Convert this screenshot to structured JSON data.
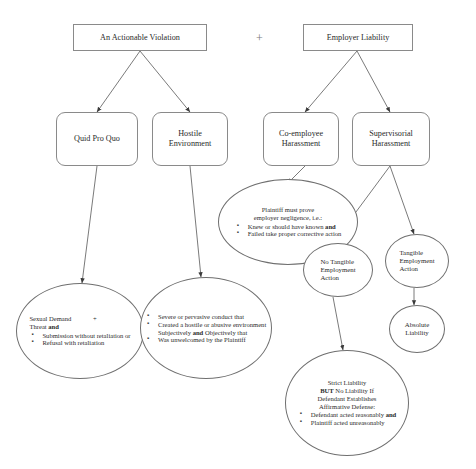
{
  "diagram": {
    "operator": "+",
    "colors": {
      "box_border": "#8a8a8a",
      "ellipse_border": "#6f6f6f",
      "text": "#2b2b2b",
      "background": "#ffffff"
    },
    "nodes": {
      "actionable_violation": {
        "label": "An Actionable Violation",
        "shape": "rectangle"
      },
      "employer_liability": {
        "label": "Employer Liability",
        "shape": "rectangle"
      },
      "quid_pro_quo": {
        "label": "Quid Pro Quo",
        "shape": "rounded-rectangle"
      },
      "hostile_environment": {
        "line1": "Hostile",
        "line2": "Environment",
        "shape": "rounded-rectangle"
      },
      "co_employee_harassment": {
        "line1": "Co-employee",
        "line2": "Harassment",
        "shape": "rounded-rectangle"
      },
      "supervisorial_harassment": {
        "line1": "Supervisorial",
        "line2": "Harassment",
        "shape": "rounded-rectangle"
      },
      "employer_negligence": {
        "shape": "ellipse",
        "lead1": "Plaintiff must prove",
        "lead2": "employer negligence, i.e.:",
        "bullets": [
          "Knew or should have known and",
          "Failed take proper corrective action"
        ]
      },
      "quid_pro_quo_elements": {
        "shape": "ellipse",
        "lead1": "Sexual Demand",
        "plus": "+",
        "lead2_pre": "Threat ",
        "lead2_bold": "and",
        "bullets": [
          "Submission without retaliation or",
          "Refusal with retaliation"
        ]
      },
      "hostile_env_elements": {
        "shape": "ellipse",
        "bullets": [
          "Severe or pervasive conduct that",
          "Created a hostile or abusive environment Subjectively and Objectively that",
          "Was unwelcomed by the Plaintiff"
        ]
      },
      "no_tangible_action": {
        "shape": "ellipse",
        "line1": "No Tangible",
        "line2": "Employment",
        "line3": "Action"
      },
      "tangible_action": {
        "shape": "ellipse",
        "line1": "Tangible",
        "line2": "Employment",
        "line3": "Action"
      },
      "absolute_liability": {
        "shape": "ellipse",
        "line1": "Absolute",
        "line2": "Liability"
      },
      "strict_liability": {
        "shape": "ellipse",
        "lead1": "Strict Liability",
        "lead2_bold": "BUT",
        "lead2_rest": " No Liability If",
        "lead3": "Defendant Establishes",
        "lead4": "Affirmative Defense:",
        "bullets": [
          "Defendant acted reasonably and",
          "Plaintiff acted unreasonably"
        ]
      }
    }
  }
}
